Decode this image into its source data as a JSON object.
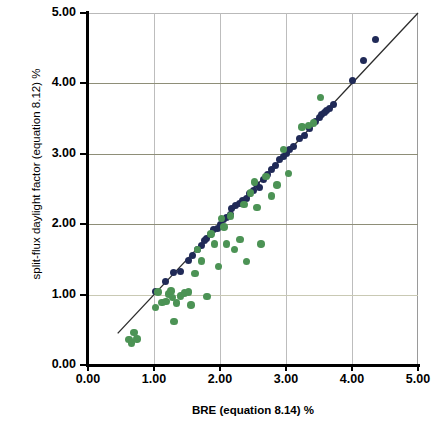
{
  "chart_data": {
    "type": "scatter",
    "title": "",
    "xlabel": "BRE (equation 8.14) %",
    "ylabel": "split-flux daylight factor (equation 8.12) %",
    "xlim": [
      0.0,
      5.0
    ],
    "ylim": [
      0.0,
      5.0
    ],
    "xticks": [
      "0.00",
      "1.00",
      "2.00",
      "3.00",
      "4.00",
      "5.00"
    ],
    "yticks": [
      "0.00",
      "1.00",
      "2.00",
      "3.00",
      "4.00",
      "5.00"
    ],
    "grid": true,
    "legend": "none",
    "colors": {
      "series_navy": "#202a57",
      "series_green": "#4c9355",
      "fit_line": "#2b2b2b",
      "grid": "#9a9a8a"
    },
    "annotations": [
      {
        "name": "identity-line",
        "type": "line",
        "from": [
          0.45,
          0.45
        ],
        "to": [
          5.0,
          5.0
        ]
      }
    ],
    "series": [
      {
        "name": "navy",
        "marker": "circle",
        "color": "#202a57",
        "points": [
          [
            1.02,
            1.04
          ],
          [
            1.18,
            1.18
          ],
          [
            1.3,
            1.32
          ],
          [
            1.4,
            1.33
          ],
          [
            1.52,
            1.48
          ],
          [
            1.58,
            1.56
          ],
          [
            1.66,
            1.64
          ],
          [
            1.72,
            1.7
          ],
          [
            1.76,
            1.77
          ],
          [
            1.8,
            1.8
          ],
          [
            1.86,
            1.86
          ],
          [
            1.9,
            1.92
          ],
          [
            1.96,
            1.94
          ],
          [
            2.0,
            1.99
          ],
          [
            2.05,
            2.06
          ],
          [
            2.1,
            2.1
          ],
          [
            2.16,
            2.14
          ],
          [
            2.18,
            2.22
          ],
          [
            2.24,
            2.26
          ],
          [
            2.3,
            2.3
          ],
          [
            2.34,
            2.34
          ],
          [
            2.4,
            2.36
          ],
          [
            2.44,
            2.44
          ],
          [
            2.5,
            2.48
          ],
          [
            2.56,
            2.56
          ],
          [
            2.6,
            2.52
          ],
          [
            2.66,
            2.64
          ],
          [
            2.72,
            2.7
          ],
          [
            2.78,
            2.78
          ],
          [
            2.84,
            2.84
          ],
          [
            2.9,
            2.92
          ],
          [
            2.96,
            2.96
          ],
          [
            3.0,
            3.0
          ],
          [
            3.06,
            3.06
          ],
          [
            3.12,
            3.1
          ],
          [
            3.2,
            3.22
          ],
          [
            3.28,
            3.26
          ],
          [
            3.36,
            3.36
          ],
          [
            3.44,
            3.46
          ],
          [
            3.5,
            3.52
          ],
          [
            3.54,
            3.56
          ],
          [
            3.58,
            3.58
          ],
          [
            3.62,
            3.62
          ],
          [
            3.66,
            3.64
          ],
          [
            3.72,
            3.7
          ],
          [
            4.0,
            4.04
          ],
          [
            4.18,
            4.32
          ],
          [
            4.36,
            4.62
          ]
        ]
      },
      {
        "name": "green",
        "marker": "circle",
        "color": "#4c9355",
        "points": [
          [
            0.62,
            0.36
          ],
          [
            0.66,
            0.31
          ],
          [
            0.7,
            0.46
          ],
          [
            0.74,
            0.37
          ],
          [
            1.02,
            0.82
          ],
          [
            1.06,
            1.04
          ],
          [
            1.12,
            0.89
          ],
          [
            1.18,
            0.9
          ],
          [
            1.22,
            1.01
          ],
          [
            1.26,
            1.05
          ],
          [
            1.28,
            0.96
          ],
          [
            1.3,
            0.62
          ],
          [
            1.34,
            0.88
          ],
          [
            1.4,
            0.98
          ],
          [
            1.46,
            1.02
          ],
          [
            1.52,
            1.04
          ],
          [
            1.56,
            0.85
          ],
          [
            1.62,
            1.3
          ],
          [
            1.66,
            1.64
          ],
          [
            1.72,
            1.48
          ],
          [
            1.8,
            0.97
          ],
          [
            1.86,
            1.86
          ],
          [
            1.92,
            1.72
          ],
          [
            1.98,
            1.4
          ],
          [
            2.02,
            2.08
          ],
          [
            2.06,
            1.96
          ],
          [
            2.1,
            1.72
          ],
          [
            2.16,
            2.12
          ],
          [
            2.22,
            1.64
          ],
          [
            2.3,
            1.78
          ],
          [
            2.36,
            2.28
          ],
          [
            2.4,
            1.47
          ],
          [
            2.46,
            2.44
          ],
          [
            2.52,
            2.6
          ],
          [
            2.56,
            2.24
          ],
          [
            2.62,
            1.72
          ],
          [
            2.7,
            2.68
          ],
          [
            2.78,
            2.4
          ],
          [
            2.86,
            2.56
          ],
          [
            2.96,
            3.06
          ],
          [
            3.04,
            2.72
          ],
          [
            3.24,
            3.38
          ],
          [
            3.34,
            3.4
          ],
          [
            3.42,
            3.44
          ],
          [
            3.52,
            3.8
          ]
        ]
      }
    ]
  },
  "axes": {
    "y_title": "split-flux daylight factor (equation 8.12) %",
    "x_title": "BRE (equation 8.14) %",
    "y_tick_labels": [
      "5.00",
      "4.00",
      "3.00",
      "2.00",
      "1.00",
      "0.00"
    ],
    "x_tick_labels": [
      "0.00",
      "1.00",
      "2.00",
      "3.00",
      "4.00",
      "5.00"
    ]
  }
}
